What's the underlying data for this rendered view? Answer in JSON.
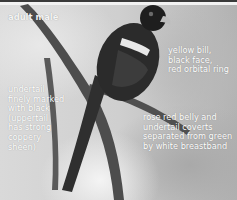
{
  "image": {
    "description": "Grayscale photo of a trogon perched on a branch with white annotation labels",
    "colors": {
      "background": "#cfcfcf",
      "label_text": "#ffffff",
      "bird_body": "#2a2a2a",
      "branch": "#4a4a4a"
    }
  },
  "labels": {
    "title": "adult male",
    "head": "yellow bill,\nblack face,\nred orbital ring",
    "undertail": "undertail\nfinely marked\nwith black\n(uppertail\nhas strong\ncoppery\nsheen)",
    "belly": "rose red belly and\nundertail coverts\nseparated from green\nby white breastband"
  }
}
